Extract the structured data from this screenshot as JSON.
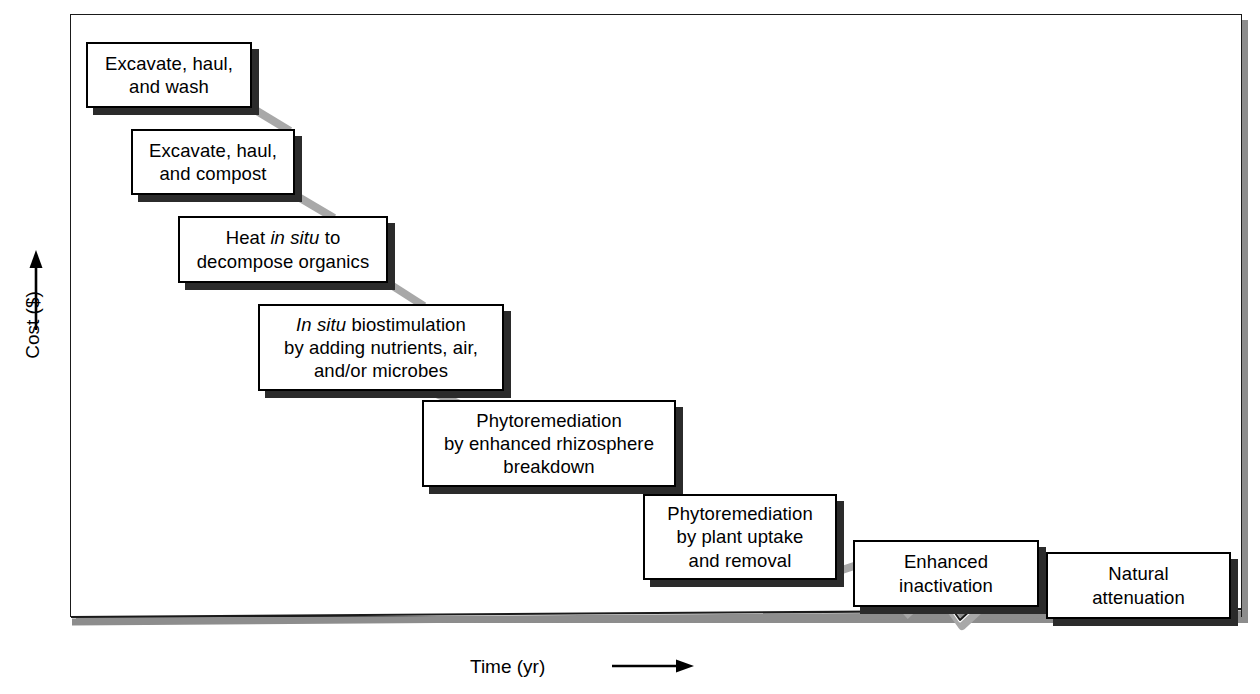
{
  "figure": {
    "axes": {
      "y_label": "Cost ($)",
      "y_arrow": "up-arrow",
      "x_label": "Time (yr)",
      "x_arrow": "right-arrow",
      "x_axis_break": true
    },
    "colors": {
      "box_border": "#000000",
      "box_fill": "#ffffff",
      "box_shadow": "#2b2b2b",
      "connector": "#a8a8a8",
      "axis": "#1a1a1a",
      "frame_shadow": "#8d8d8d",
      "background": "#ffffff"
    }
  },
  "chart_data": {
    "type": "diagram",
    "xlabel": "Time (yr)",
    "ylabel": "Cost ($)",
    "note": "Descending staircase: cost decreases as required time increases",
    "categories": [
      "Excavate, haul, and wash",
      "Excavate, haul, and compost",
      "Heat in situ to decompose organics",
      "In situ biostimulation by adding nutrients, air, and/or microbes",
      "Phytoremediation by enhanced rhizosphere breakdown",
      "Phytoremediation by plant uptake and removal",
      "Enhanced inactivation",
      "Natural attenuation"
    ],
    "cost_rank": [
      8,
      7,
      6,
      5,
      4,
      3,
      2,
      1
    ],
    "time_rank": [
      1,
      2,
      3,
      4,
      5,
      6,
      7,
      8
    ]
  },
  "steps": [
    {
      "id": "excavate-haul-wash",
      "lines": [
        [
          {
            "t": "Excavate, haul,",
            "i": false
          }
        ],
        [
          {
            "t": "and wash",
            "i": false
          }
        ]
      ],
      "x": 86,
      "y": 42,
      "w": 166,
      "h": 66
    },
    {
      "id": "excavate-haul-compost",
      "lines": [
        [
          {
            "t": "Excavate, haul,",
            "i": false
          }
        ],
        [
          {
            "t": "and compost",
            "i": false
          }
        ]
      ],
      "x": 131,
      "y": 129,
      "w": 164,
      "h": 66
    },
    {
      "id": "heat-in-situ",
      "lines": [
        [
          {
            "t": "Heat ",
            "i": false
          },
          {
            "t": "in situ",
            "i": true
          },
          {
            "t": " to",
            "i": false
          }
        ],
        [
          {
            "t": "decompose organics",
            "i": false
          }
        ]
      ],
      "x": 178,
      "y": 216,
      "w": 210,
      "h": 67
    },
    {
      "id": "in-situ-biostimulation",
      "lines": [
        [
          {
            "t": "In situ",
            "i": true
          },
          {
            "t": " biostimulation",
            "i": false
          }
        ],
        [
          {
            "t": "by adding nutrients, air,",
            "i": false
          }
        ],
        [
          {
            "t": "and/or microbes",
            "i": false
          }
        ]
      ],
      "x": 258,
      "y": 304,
      "w": 246,
      "h": 87
    },
    {
      "id": "phyto-rhizosphere",
      "lines": [
        [
          {
            "t": "Phytoremediation",
            "i": false
          }
        ],
        [
          {
            "t": "by enhanced rhizosphere",
            "i": false
          }
        ],
        [
          {
            "t": "breakdown",
            "i": false
          }
        ]
      ],
      "x": 422,
      "y": 400,
      "w": 254,
      "h": 87
    },
    {
      "id": "phyto-plant-uptake",
      "lines": [
        [
          {
            "t": "Phytoremediation",
            "i": false
          }
        ],
        [
          {
            "t": "by plant uptake",
            "i": false
          }
        ],
        [
          {
            "t": "and removal",
            "i": false
          }
        ]
      ],
      "x": 643,
      "y": 494,
      "w": 194,
      "h": 86
    },
    {
      "id": "enhanced-inactivation",
      "lines": [
        [
          {
            "t": "Enhanced",
            "i": false
          }
        ],
        [
          {
            "t": "inactivation",
            "i": false
          }
        ]
      ],
      "x": 853,
      "y": 540,
      "w": 186,
      "h": 67
    },
    {
      "id": "natural-attenuation",
      "lines": [
        [
          {
            "t": "Natural",
            "i": false
          }
        ],
        [
          {
            "t": "attenuation",
            "i": false
          }
        ]
      ],
      "x": 1046,
      "y": 552,
      "w": 185,
      "h": 67
    }
  ],
  "connectors": [
    {
      "id": "c1",
      "x1": 252,
      "y1": 108,
      "x2": 290,
      "y2": 131
    },
    {
      "id": "c2",
      "x1": 295,
      "y1": 195,
      "x2": 334,
      "y2": 218
    },
    {
      "id": "c3",
      "x1": 388,
      "y1": 283,
      "x2": 424,
      "y2": 306
    },
    {
      "id": "c4",
      "x1": 430,
      "y1": 391,
      "x2": 464,
      "y2": 406
    },
    {
      "id": "c5",
      "x1": 632,
      "y1": 487,
      "x2": 672,
      "y2": 498
    },
    {
      "id": "c6",
      "x1": 830,
      "y1": 574,
      "x2": 872,
      "y2": 560
    },
    {
      "id": "c7",
      "x1": 1032,
      "y1": 600,
      "x2": 1070,
      "y2": 586
    }
  ]
}
